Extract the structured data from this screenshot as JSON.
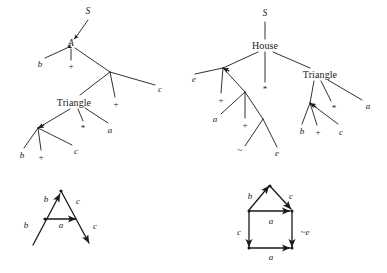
{
  "figure": {
    "width": 387,
    "height": 273,
    "stroke_color": "#1a1a1a",
    "text_color": "#1a1a1a",
    "background": "#ffffff"
  },
  "panels": [
    {
      "id": "top-left-tree",
      "kind": "derivation-tree",
      "root": "S",
      "labels": [
        {
          "id": "tl-S",
          "text": "S",
          "x": 88,
          "y": 12,
          "style": "italic",
          "size": "nt"
        },
        {
          "id": "tl-A",
          "text": "A",
          "x": 71,
          "y": 44,
          "style": "italic",
          "size": "nt"
        },
        {
          "id": "tl-b1",
          "text": "b",
          "x": 40,
          "y": 64,
          "style": "italic",
          "size": "term"
        },
        {
          "id": "tl-plus1",
          "text": "+",
          "x": 71,
          "y": 66,
          "style": "roman",
          "size": "op"
        },
        {
          "id": "tl-c1",
          "text": "c",
          "x": 160,
          "y": 89,
          "style": "italic",
          "size": "term"
        },
        {
          "id": "tl-triangle",
          "text": "Triangle",
          "x": 74,
          "y": 103,
          "style": "roman",
          "size": "word"
        },
        {
          "id": "tl-plus2",
          "text": "+",
          "x": 116,
          "y": 104,
          "style": "roman",
          "size": "op"
        },
        {
          "id": "tl-star",
          "text": "*",
          "x": 83,
          "y": 128,
          "style": "roman",
          "size": "op"
        },
        {
          "id": "tl-a1",
          "text": "a",
          "x": 110,
          "y": 130,
          "style": "italic",
          "size": "term"
        },
        {
          "id": "tl-b2",
          "text": "b",
          "x": 22,
          "y": 155,
          "style": "italic",
          "size": "term"
        },
        {
          "id": "tl-plus3",
          "text": "+",
          "x": 41,
          "y": 157,
          "style": "roman",
          "size": "op"
        },
        {
          "id": "tl-c2",
          "text": "c",
          "x": 76,
          "y": 151,
          "style": "italic",
          "size": "term"
        }
      ]
    },
    {
      "id": "top-right-tree",
      "kind": "derivation-tree",
      "root": "S",
      "labels": [
        {
          "id": "tr-S",
          "text": "S",
          "x": 265,
          "y": 14,
          "style": "italic",
          "size": "nt"
        },
        {
          "id": "tr-house",
          "text": "House",
          "x": 265,
          "y": 46,
          "style": "roman",
          "size": "word"
        },
        {
          "id": "tr-e1",
          "text": "e",
          "x": 194,
          "y": 79,
          "style": "italic",
          "size": "term"
        },
        {
          "id": "tr-star1",
          "text": "*",
          "x": 265,
          "y": 89,
          "style": "roman",
          "size": "op"
        },
        {
          "id": "tr-triangle",
          "text": "Triangle",
          "x": 320,
          "y": 75,
          "style": "roman",
          "size": "word"
        },
        {
          "id": "tr-plus1",
          "text": "+",
          "x": 221,
          "y": 100,
          "style": "roman",
          "size": "op"
        },
        {
          "id": "tr-a1",
          "text": "a",
          "x": 215,
          "y": 119,
          "style": "italic",
          "size": "term"
        },
        {
          "id": "tr-a2",
          "text": "a",
          "x": 368,
          "y": 106,
          "style": "italic",
          "size": "term"
        },
        {
          "id": "tr-star2",
          "text": "*",
          "x": 334,
          "y": 108,
          "style": "roman",
          "size": "op"
        },
        {
          "id": "tr-plus2",
          "text": "+",
          "x": 245,
          "y": 125,
          "style": "roman",
          "size": "op"
        },
        {
          "id": "tr-b1",
          "text": "b",
          "x": 302,
          "y": 131,
          "style": "italic",
          "size": "term"
        },
        {
          "id": "tr-plus3",
          "text": "+",
          "x": 318,
          "y": 132,
          "style": "roman",
          "size": "op"
        },
        {
          "id": "tr-c1",
          "text": "c",
          "x": 341,
          "y": 132,
          "style": "italic",
          "size": "term"
        },
        {
          "id": "tr-tilde",
          "text": "~",
          "x": 240,
          "y": 150,
          "style": "roman",
          "size": "op"
        },
        {
          "id": "tr-e2",
          "text": "e",
          "x": 277,
          "y": 153,
          "style": "italic",
          "size": "term"
        }
      ]
    },
    {
      "id": "bottom-left-graph",
      "kind": "graph",
      "shape": "A-shape",
      "labels": [
        {
          "id": "bl-b-top",
          "text": "b",
          "x": 46,
          "y": 199,
          "style": "italic",
          "size": "term"
        },
        {
          "id": "bl-c-top",
          "text": "c",
          "x": 78,
          "y": 201,
          "style": "italic",
          "size": "term"
        },
        {
          "id": "bl-b-left",
          "text": "b",
          "x": 26,
          "y": 225,
          "style": "italic",
          "size": "term"
        },
        {
          "id": "bl-a-mid",
          "text": "a",
          "x": 61,
          "y": 225,
          "style": "italic",
          "size": "term"
        },
        {
          "id": "bl-c-right",
          "text": "c",
          "x": 95,
          "y": 226,
          "style": "italic",
          "size": "term"
        }
      ]
    },
    {
      "id": "bottom-right-graph",
      "kind": "graph",
      "shape": "house-shape",
      "labels": [
        {
          "id": "br-b-roof",
          "text": "b",
          "x": 250,
          "y": 196,
          "style": "italic",
          "size": "term"
        },
        {
          "id": "br-c-roof",
          "text": "c",
          "x": 291,
          "y": 196,
          "style": "italic",
          "size": "term"
        },
        {
          "id": "br-a-mid",
          "text": "a",
          "x": 271,
          "y": 221,
          "style": "italic",
          "size": "term"
        },
        {
          "id": "br-c-left",
          "text": "c",
          "x": 239,
          "y": 232,
          "style": "italic",
          "size": "term"
        },
        {
          "id": "br-notE",
          "text": "~e",
          "x": 305,
          "y": 232,
          "style": "italic",
          "size": "term"
        },
        {
          "id": "br-a-bot",
          "text": "a",
          "x": 271,
          "y": 257,
          "style": "italic",
          "size": "term"
        }
      ]
    }
  ]
}
